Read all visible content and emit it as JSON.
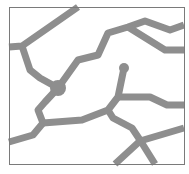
{
  "map": {
    "width": 189,
    "height": 174,
    "background": "#ffffff",
    "frame": {
      "x": 9,
      "y": 7,
      "width": 175,
      "height": 157,
      "stroke": "#7a7a7a",
      "stroke_width": 1
    },
    "road_color": "#8e8e8e",
    "road_width": 7,
    "roads": [
      {
        "id": "road-a",
        "points": "78,7 22,46 9,47"
      },
      {
        "id": "road-b",
        "points": "22,46 30,70 40,78 58,88"
      },
      {
        "id": "road-c",
        "points": "58,88 78,60 98,55 108,33 128,27 145,21 170,30 184,25"
      },
      {
        "id": "road-d",
        "points": "128,27 165,50 184,50"
      },
      {
        "id": "road-e",
        "points": "58,88 45,102 38,110 43,123 33,135 9,142"
      },
      {
        "id": "road-f",
        "points": "43,123 82,120 95,115 108,110 118,97 124,68"
      },
      {
        "id": "road-g",
        "points": "118,97 150,97 167,105 184,105"
      },
      {
        "id": "road-h",
        "points": "108,110 113,118 132,128 140,140 155,164"
      },
      {
        "id": "road-i",
        "points": "184,128 140,141 115,164"
      }
    ],
    "nodes": [
      {
        "id": "junction-node",
        "cx": 58,
        "cy": 88,
        "r": 8
      },
      {
        "id": "road-end-node",
        "cx": 124,
        "cy": 68,
        "r": 5
      }
    ]
  }
}
